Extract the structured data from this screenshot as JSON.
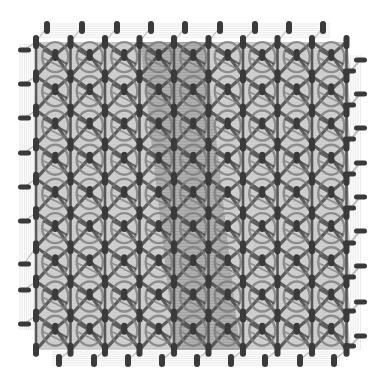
{
  "diagram": {
    "type": "lattice-graph",
    "colors": {
      "background": "#ffffff",
      "node": "#3a3a3a",
      "edge_dark": "#4a4a4a",
      "edge_mid": "#7a7a7a",
      "edge_light": "#bdbdbd",
      "edge_faint": "#d8d8d8",
      "center_band": "#2e2e2e"
    },
    "lattice": {
      "cols": 9,
      "rows": 9,
      "origin_x": 36,
      "origin_y": 42,
      "cell_w": 34.5,
      "cell_h": 34.2
    },
    "boundary_nodes": {
      "top": {
        "count": 9,
        "y": 27,
        "xs": [
          47,
          82,
          117,
          151,
          185,
          220,
          255,
          289,
          323
        ]
      },
      "bottom": {
        "count": 9,
        "y": 360,
        "xs": [
          59,
          94,
          128,
          162,
          197,
          231,
          265,
          300,
          334
        ]
      },
      "left": {
        "count": 9,
        "x": 24,
        "ys": [
          50,
          84,
          118,
          153,
          187,
          221,
          264,
          290,
          324
        ]
      },
      "right_outer": {
        "count": 9,
        "x": 360,
        "ys": [
          60,
          94,
          128,
          163,
          197,
          231,
          266,
          302,
          336
        ]
      },
      "right_inner": {
        "count": 9,
        "x": 349,
        "ys": [
          71,
          105,
          139,
          174,
          208,
          243,
          277,
          311,
          346
        ]
      }
    }
  }
}
